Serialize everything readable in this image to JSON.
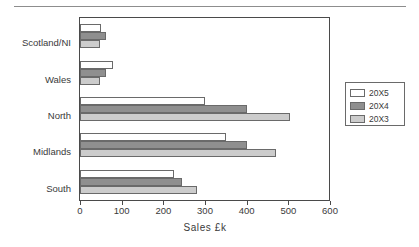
{
  "page": {
    "divider_present": true
  },
  "chart_data": {
    "type": "bar",
    "orientation": "horizontal",
    "title": "",
    "xlabel": "Sales  £k",
    "ylabel": "",
    "categories": [
      "Scotland/NI",
      "Wales",
      "North",
      "Midlands",
      "South"
    ],
    "series": [
      {
        "name": "20X5",
        "color": "#ffffff",
        "values": [
          50,
          80,
          300,
          350,
          225
        ]
      },
      {
        "name": "20X4",
        "color": "#8f8f8f",
        "values": [
          62,
          62,
          400,
          400,
          245
        ]
      },
      {
        "name": "20X3",
        "color": "#cccccc",
        "values": [
          48,
          48,
          505,
          470,
          280
        ]
      }
    ],
    "xlim": [
      0,
      600
    ],
    "xticks": [
      0,
      100,
      200,
      300,
      400,
      500,
      600
    ],
    "xtick_labels": [
      "0",
      "100",
      "200",
      "300",
      "400",
      "500",
      "600"
    ],
    "grid": false,
    "legend_position": "right",
    "legend_entries": [
      "20X5",
      "20X4",
      "20X3"
    ]
  }
}
